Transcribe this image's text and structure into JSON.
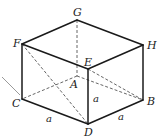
{
  "diagram": {
    "type": "rectangular-prism",
    "vertices": {
      "G": {
        "label": "G",
        "x": 77,
        "y": 20
      },
      "F": {
        "label": "F",
        "x": 22,
        "y": 44
      },
      "H": {
        "label": "H",
        "x": 143,
        "y": 45
      },
      "E": {
        "label": "E",
        "x": 88,
        "y": 69
      },
      "A": {
        "label": "A",
        "x": 77,
        "y": 76
      },
      "C": {
        "label": "C",
        "x": 22,
        "y": 99
      },
      "B": {
        "label": "B",
        "x": 143,
        "y": 100
      },
      "D": {
        "label": "D",
        "x": 88,
        "y": 124
      }
    },
    "solid_edges": [
      "GF",
      "GH",
      "FE",
      "HE",
      "FC",
      "ED",
      "HB",
      "CD",
      "DB"
    ],
    "hidden_edges": [
      "GA",
      "AC",
      "AB"
    ],
    "dashed_diagonals": [
      "FD",
      "EB"
    ],
    "edge_labels": [
      {
        "edge": "CD",
        "text": "a"
      },
      {
        "edge": "ED",
        "text": "a"
      },
      {
        "edge": "DB",
        "text": "a"
      }
    ],
    "colors": {
      "edge": "#1a1a1a",
      "hidden": "#555555",
      "arrow": "#9a9a9a"
    }
  }
}
